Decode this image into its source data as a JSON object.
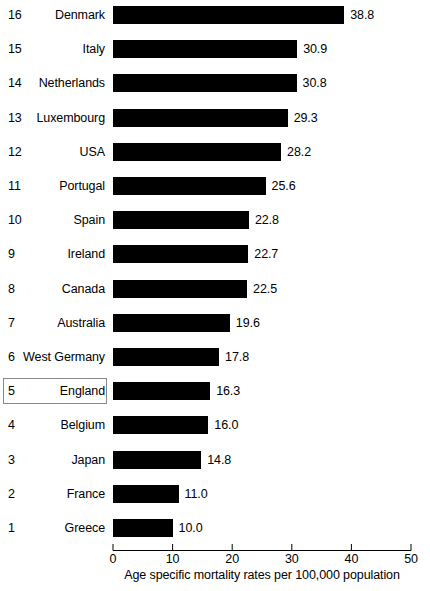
{
  "chart_data": {
    "type": "bar",
    "orientation": "horizontal",
    "title": "",
    "xlabel": "Age specific mortality rates per 100,000 population",
    "ylabel": "",
    "xlim": [
      0,
      50
    ],
    "xticks": [
      0,
      10,
      20,
      30,
      40,
      50
    ],
    "grid": false,
    "legend": null,
    "bar_color": "#000000",
    "highlight_color": "#8a8a8a",
    "highlighted_category": "England",
    "categories": [
      "Denmark",
      "Italy",
      "Netherlands",
      "Luxembourg",
      "USA",
      "Portugal",
      "Spain",
      "Ireland",
      "Canada",
      "Australia",
      "West Germany",
      "England",
      "Belgium",
      "Japan",
      "France",
      "Greece"
    ],
    "ranks": [
      16,
      15,
      14,
      13,
      12,
      11,
      10,
      9,
      8,
      7,
      6,
      5,
      4,
      3,
      2,
      1
    ],
    "values": [
      38.8,
      30.9,
      30.8,
      29.3,
      28.2,
      25.6,
      22.8,
      22.7,
      22.5,
      19.6,
      17.8,
      16.3,
      16.0,
      14.8,
      11.0,
      10.0
    ],
    "value_labels": [
      "38.8",
      "30.9",
      "30.8",
      "29.3",
      "28.2",
      "25.6",
      "22.8",
      "22.7",
      "22.5",
      "19.6",
      "17.8",
      "16.3",
      "16.0",
      "14.8",
      "11.0",
      "10.0"
    ],
    "rank_labels": [
      "16",
      "15",
      "14",
      "13",
      "12",
      "11",
      "10",
      "9",
      "8",
      "7",
      "6",
      "5",
      "4",
      "3",
      "2",
      "1"
    ],
    "xtick_labels": [
      "0",
      "10",
      "20",
      "30",
      "40",
      "50"
    ]
  }
}
